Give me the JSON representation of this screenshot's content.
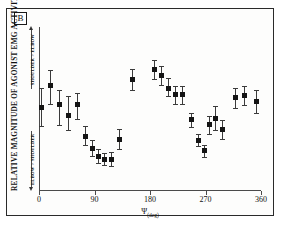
{
  "figure": {
    "panel_label": "B",
    "background_color": "#ffffff",
    "frame_color": "#2a2a2a",
    "marker_color": "#141414",
    "errorbar_color": "#3b3b3b"
  },
  "axes": {
    "y_title": "RELATIVE MAGNITUDE OF AGONIST EMG ACTIVITY",
    "x_label_symbol": "Ψ",
    "x_label_unit": "(deg)",
    "x_ticks": [
      "0",
      "90",
      "180",
      "270",
      "360"
    ],
    "bracket_upper_label": "SHOULDER > ELBOW",
    "bracket_lower_label": "ELBOW > SHOULDER"
  },
  "chart_data": {
    "type": "scatter",
    "title": "B",
    "xlabel": "Ψ (deg)",
    "ylabel": "RELATIVE MAGNITUDE OF AGONIST EMG ACTIVITY",
    "xlim": [
      0,
      360
    ],
    "ylim": [
      0,
      1
    ],
    "grid": false,
    "legend": "none",
    "xtick_values": [
      0,
      90,
      180,
      270,
      360
    ],
    "xtick_labels": [
      "0",
      "90",
      "180",
      "270",
      "360"
    ],
    "ytick_labels": [],
    "y_axis_note": "Y axis unlabeled; relative scale from ELBOW > SHOULDER (low) to SHOULDER > ELBOW (high)",
    "series": [
      {
        "name": "Agonist EMG magnitude",
        "marker": "filled-square",
        "error": "vertical error bars with caps",
        "points": [
          {
            "x": 4,
            "y": 0.505,
            "yerr_low": 0.115,
            "yerr_high": 0.12
          },
          {
            "x": 18,
            "y": 0.64,
            "yerr_low": 0.11,
            "yerr_high": 0.095
          },
          {
            "x": 33,
            "y": 0.525,
            "yerr_low": 0.125,
            "yerr_high": 0.09
          },
          {
            "x": 48,
            "y": 0.455,
            "yerr_low": 0.085,
            "yerr_high": 0.12
          },
          {
            "x": 62,
            "y": 0.525,
            "yerr_low": 0.09,
            "yerr_high": 0.07
          },
          {
            "x": 76,
            "y": 0.33,
            "yerr_low": 0.055,
            "yerr_high": 0.06
          },
          {
            "x": 86,
            "y": 0.255,
            "yerr_low": 0.045,
            "yerr_high": 0.05
          },
          {
            "x": 96,
            "y": 0.205,
            "yerr_low": 0.04,
            "yerr_high": 0.045
          },
          {
            "x": 107,
            "y": 0.19,
            "yerr_low": 0.035,
            "yerr_high": 0.04
          },
          {
            "x": 118,
            "y": 0.19,
            "yerr_low": 0.04,
            "yerr_high": 0.045
          },
          {
            "x": 130,
            "y": 0.31,
            "yerr_low": 0.06,
            "yerr_high": 0.065
          },
          {
            "x": 152,
            "y": 0.68,
            "yerr_low": 0.065,
            "yerr_high": 0.065
          },
          {
            "x": 188,
            "y": 0.74,
            "yerr_low": 0.06,
            "yerr_high": 0.055
          },
          {
            "x": 198,
            "y": 0.7,
            "yerr_low": 0.055,
            "yerr_high": 0.06
          },
          {
            "x": 210,
            "y": 0.625,
            "yerr_low": 0.05,
            "yerr_high": 0.06
          },
          {
            "x": 222,
            "y": 0.585,
            "yerr_low": 0.055,
            "yerr_high": 0.055
          },
          {
            "x": 232,
            "y": 0.585,
            "yerr_low": 0.06,
            "yerr_high": 0.055
          },
          {
            "x": 248,
            "y": 0.43,
            "yerr_low": 0.045,
            "yerr_high": 0.045
          },
          {
            "x": 258,
            "y": 0.305,
            "yerr_low": 0.035,
            "yerr_high": 0.04
          },
          {
            "x": 268,
            "y": 0.24,
            "yerr_low": 0.035,
            "yerr_high": 0.035
          },
          {
            "x": 276,
            "y": 0.4,
            "yerr_low": 0.055,
            "yerr_high": 0.055
          },
          {
            "x": 287,
            "y": 0.44,
            "yerr_low": 0.07,
            "yerr_high": 0.075
          },
          {
            "x": 297,
            "y": 0.37,
            "yerr_low": 0.06,
            "yerr_high": 0.06
          },
          {
            "x": 318,
            "y": 0.565,
            "yerr_low": 0.06,
            "yerr_high": 0.06
          },
          {
            "x": 334,
            "y": 0.58,
            "yerr_low": 0.06,
            "yerr_high": 0.06
          },
          {
            "x": 352,
            "y": 0.545,
            "yerr_low": 0.07,
            "yerr_high": 0.07
          }
        ]
      }
    ]
  }
}
